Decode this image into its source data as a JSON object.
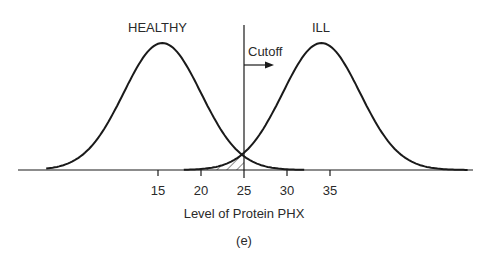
{
  "chart_data": {
    "type": "line",
    "title": "",
    "xlabel": "Level of Protein PHX",
    "ylabel": "",
    "caption": "(e)",
    "x_ticks": [
      15,
      20,
      25,
      30,
      35
    ],
    "x_tick_labels": [
      "15",
      "20",
      "25",
      "30",
      "35"
    ],
    "xlim": [
      2,
      51
    ],
    "grid": false,
    "legend": null,
    "series": [
      {
        "name": "HEALTHY",
        "distribution": "normal",
        "mean": 15.5,
        "approx_sd": 4.5,
        "x_range": [
          2,
          32
        ]
      },
      {
        "name": "ILL",
        "distribution": "normal",
        "mean": 34,
        "approx_sd": 4.5,
        "x_range": [
          18,
          51
        ]
      }
    ],
    "annotations": [
      {
        "text": "Cutoff",
        "type": "vertical-line-with-right-arrow",
        "x": 25
      },
      {
        "text": "",
        "type": "hatched-region",
        "x_range": [
          18,
          25
        ],
        "description": "Area under ILL curve left of cutoff (false negatives)"
      }
    ]
  },
  "labels": {
    "healthy": "HEALTHY",
    "ill": "ILL",
    "cutoff": "Cutoff",
    "xlabel": "Level of Protein PHX",
    "caption": "(e)"
  },
  "ticks": [
    "15",
    "20",
    "25",
    "30",
    "35"
  ],
  "colors": {
    "line": "#1a1a1a",
    "text": "#2a2a2a",
    "background": "#ffffff"
  }
}
